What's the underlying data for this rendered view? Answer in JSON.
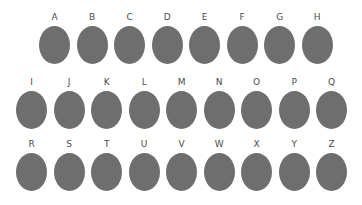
{
  "figure": {
    "background_color": "#ffffff",
    "shape_color": "#6e6e6e",
    "label_color": "#4a4a4a",
    "shape_type": "ellipse",
    "total_shapes": 26,
    "rows": [
      {
        "row_index": 1,
        "count": 8,
        "labels": [
          "A",
          "B",
          "C",
          "D",
          "E",
          "F",
          "G",
          "H"
        ]
      },
      {
        "row_index": 2,
        "count": 9,
        "labels": [
          "I",
          "J",
          "K",
          "L",
          "M",
          "N",
          "O",
          "P",
          "Q"
        ]
      },
      {
        "row_index": 3,
        "count": 9,
        "labels": [
          "R",
          "S",
          "T",
          "U",
          "V",
          "W",
          "X",
          "Y",
          "Z"
        ]
      }
    ]
  }
}
